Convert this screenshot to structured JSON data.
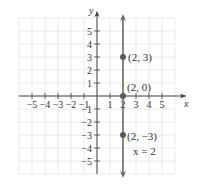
{
  "chart_data": {
    "type": "scatter",
    "title": "",
    "xlabel": "x",
    "ylabel": "y",
    "xlim": [
      -6,
      6
    ],
    "ylim": [
      -6,
      6
    ],
    "grid": true,
    "legend": null,
    "x_ticks": [
      -5,
      -4,
      -3,
      -2,
      -1,
      1,
      2,
      3,
      4,
      5
    ],
    "y_ticks": [
      -5,
      -4,
      -3,
      -2,
      -1,
      1,
      2,
      3,
      4,
      5
    ],
    "x_tick_labels": [
      "−5",
      "−4",
      "−3",
      "−2",
      "−1",
      "1",
      "2",
      "3",
      "4",
      "5"
    ],
    "y_tick_labels": [
      "−5",
      "−4",
      "−3",
      "−2",
      "−1",
      "1",
      "2",
      "3",
      "4",
      "5"
    ],
    "series": [
      {
        "name": "x = 2",
        "kind": "vertical-line",
        "x": 2,
        "label": "x = 2",
        "color": "#666666"
      },
      {
        "name": "points",
        "kind": "points",
        "points": [
          {
            "x": 2,
            "y": 3,
            "label": "(2, 3)"
          },
          {
            "x": 2,
            "y": 0,
            "label": "(2, 0)"
          },
          {
            "x": 2,
            "y": -3,
            "label": "(2, −3)"
          }
        ],
        "color": "#555555"
      }
    ],
    "annotations": [
      "(2, 3)",
      "(2, 0)",
      "(2, −3)",
      "x = 2"
    ]
  },
  "labels": {
    "x_axis": "x",
    "y_axis": "y",
    "equation": "x = 2",
    "p1": "(2, 3)",
    "p2": "(2, 0)",
    "p3": "(2, −3)"
  },
  "colors": {
    "grid": "#e4e4e4",
    "axis": "#444444",
    "line": "#6a6a6a",
    "point": "#5a5a5a"
  }
}
